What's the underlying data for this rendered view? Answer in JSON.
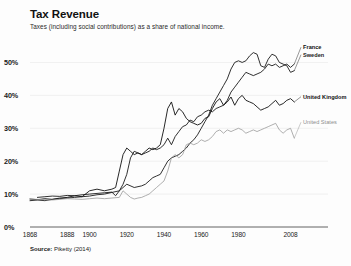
{
  "header": {
    "title": "Tax Revenue",
    "subtitle": "Taxes (including social contributions) as a share of national income."
  },
  "footer": {
    "source_label": "Source:",
    "source_value": "Piketty (2014)"
  },
  "legend": [
    {
      "name": "france-label",
      "label": "France",
      "color": "#1a1a1a",
      "weight": "bold"
    },
    {
      "name": "sweden-label",
      "label": "Sweden",
      "color": "#1a1a1a",
      "weight": "bold"
    },
    {
      "name": "united-kingdom-label",
      "label": "United Kingdom",
      "color": "#111111",
      "weight": "bold"
    },
    {
      "name": "united-states-label",
      "label": "United States",
      "color": "#8d8d8d",
      "weight": "normal"
    }
  ],
  "chart_data": {
    "type": "line",
    "title": "Tax Revenue",
    "subtitle": "Taxes (including social contributions) as a share of national income.",
    "xlabel": "",
    "ylabel": "",
    "xlim": [
      1868,
      2012
    ],
    "ylim": [
      0,
      55
    ],
    "grid": true,
    "legend_position": "right-inline",
    "ytick_labels": [
      "0%",
      "10%",
      "20%",
      "30%",
      "40%",
      "50%"
    ],
    "ytick_values": [
      0,
      10,
      20,
      30,
      40,
      50
    ],
    "xtick_labels": [
      "1868",
      "1888",
      "1900",
      "1920",
      "1940",
      "1960",
      "1980",
      "2008"
    ],
    "xtick_values": [
      1868,
      1888,
      1900,
      1920,
      1940,
      1960,
      1980,
      2008
    ],
    "series": [
      {
        "name": "France",
        "color": "#1a1a1a",
        "width": 0.9,
        "x": [
          1872,
          1876,
          1880,
          1884,
          1888,
          1892,
          1896,
          1900,
          1904,
          1908,
          1912,
          1914,
          1916,
          1918,
          1920,
          1922,
          1924,
          1926,
          1928,
          1930,
          1932,
          1934,
          1936,
          1938,
          1940,
          1942,
          1944,
          1946,
          1948,
          1950,
          1952,
          1954,
          1956,
          1958,
          1960,
          1962,
          1964,
          1966,
          1968,
          1970,
          1972,
          1974,
          1976,
          1978,
          1980,
          1982,
          1984,
          1986,
          1988,
          1990,
          1992,
          1994,
          1996,
          1998,
          2000,
          2002,
          2004,
          2006,
          2008,
          2010
        ],
        "y": [
          9.0,
          9.2,
          9.4,
          9.3,
          9.6,
          9.5,
          9.8,
          10.0,
          10.2,
          10.4,
          10.6,
          9.5,
          11.0,
          13.0,
          16.0,
          21.0,
          23.0,
          22.5,
          22.0,
          22.5,
          23.0,
          24.0,
          23.5,
          24.0,
          25.0,
          27.0,
          25.0,
          27.5,
          29.0,
          30.5,
          31.0,
          32.5,
          32.0,
          33.5,
          34.0,
          35.0,
          35.5,
          35.0,
          36.0,
          36.5,
          37.0,
          38.5,
          41.0,
          42.5,
          44.0,
          45.5,
          47.0,
          46.5,
          46.0,
          46.5,
          47.0,
          48.0,
          49.5,
          49.0,
          49.5,
          48.5,
          49.0,
          49.5,
          48.5,
          49.5
        ]
      },
      {
        "name": "Sweden",
        "color": "#1a1a1a",
        "width": 0.9,
        "x": [
          1868,
          1872,
          1876,
          1880,
          1884,
          1888,
          1892,
          1896,
          1900,
          1904,
          1908,
          1912,
          1916,
          1920,
          1924,
          1928,
          1930,
          1932,
          1934,
          1936,
          1938,
          1940,
          1942,
          1944,
          1946,
          1948,
          1950,
          1952,
          1954,
          1956,
          1958,
          1960,
          1962,
          1964,
          1966,
          1968,
          1970,
          1972,
          1974,
          1976,
          1978,
          1980,
          1982,
          1984,
          1986,
          1988,
          1990,
          1992,
          1994,
          1996,
          1998,
          2000,
          2002,
          2004,
          2006,
          2008,
          2010
        ],
        "y": [
          8.0,
          8.2,
          8.0,
          8.4,
          8.6,
          8.8,
          9.0,
          9.2,
          9.4,
          9.8,
          10.0,
          10.5,
          11.0,
          13.0,
          12.0,
          12.5,
          13.0,
          14.0,
          15.0,
          15.5,
          16.0,
          18.0,
          20.0,
          21.0,
          21.5,
          22.0,
          23.0,
          24.0,
          25.5,
          26.5,
          28.0,
          30.0,
          32.0,
          34.0,
          37.0,
          39.0,
          41.0,
          43.0,
          45.0,
          48.0,
          50.0,
          50.5,
          50.0,
          50.5,
          52.0,
          53.0,
          52.5,
          49.0,
          48.5,
          51.0,
          52.5,
          52.0,
          50.0,
          49.5,
          49.0,
          47.0,
          47.5
        ]
      },
      {
        "name": "United Kingdom",
        "color": "#111111",
        "width": 0.9,
        "x": [
          1868,
          1872,
          1876,
          1880,
          1884,
          1888,
          1892,
          1896,
          1900,
          1904,
          1908,
          1912,
          1914,
          1916,
          1918,
          1920,
          1922,
          1924,
          1926,
          1928,
          1930,
          1932,
          1934,
          1936,
          1938,
          1940,
          1942,
          1944,
          1946,
          1948,
          1950,
          1952,
          1954,
          1956,
          1958,
          1960,
          1962,
          1964,
          1966,
          1968,
          1970,
          1972,
          1974,
          1976,
          1978,
          1980,
          1982,
          1984,
          1986,
          1988,
          1990,
          1992,
          1994,
          1996,
          1998,
          2000,
          2002,
          2004,
          2006,
          2008,
          2010
        ],
        "y": [
          8.5,
          8.3,
          8.6,
          8.4,
          8.8,
          9.0,
          9.5,
          9.2,
          11.0,
          11.5,
          11.0,
          11.5,
          12.0,
          17.0,
          22.0,
          24.0,
          23.0,
          22.0,
          22.5,
          22.0,
          23.0,
          24.0,
          23.5,
          24.0,
          25.0,
          30.0,
          36.0,
          38.0,
          34.0,
          36.0,
          35.0,
          33.0,
          32.0,
          31.5,
          31.0,
          31.5,
          33.0,
          33.5,
          36.0,
          38.0,
          39.0,
          37.0,
          38.0,
          39.5,
          37.0,
          39.0,
          40.0,
          38.5,
          38.0,
          37.5,
          36.5,
          35.5,
          36.0,
          36.5,
          37.5,
          38.5,
          37.0,
          37.5,
          38.5,
          39.0,
          38.0
        ]
      },
      {
        "name": "United States",
        "color": "#9a9a9a",
        "width": 0.8,
        "x": [
          1868,
          1872,
          1876,
          1880,
          1884,
          1888,
          1892,
          1896,
          1900,
          1904,
          1908,
          1912,
          1916,
          1918,
          1920,
          1922,
          1924,
          1926,
          1928,
          1930,
          1932,
          1934,
          1936,
          1938,
          1940,
          1942,
          1944,
          1946,
          1948,
          1950,
          1952,
          1954,
          1956,
          1958,
          1960,
          1962,
          1964,
          1966,
          1968,
          1970,
          1972,
          1974,
          1976,
          1978,
          1980,
          1982,
          1984,
          1986,
          1988,
          1990,
          1992,
          1994,
          1996,
          1998,
          2000,
          2002,
          2004,
          2006,
          2008,
          2010
        ],
        "y": [
          8.5,
          8.4,
          8.3,
          8.2,
          8.4,
          8.6,
          8.5,
          8.4,
          8.6,
          8.8,
          8.6,
          8.8,
          9.0,
          11.0,
          10.0,
          9.0,
          8.5,
          8.8,
          9.0,
          9.5,
          10.0,
          11.0,
          12.0,
          13.0,
          14.0,
          17.0,
          21.0,
          22.0,
          21.0,
          22.0,
          25.0,
          25.5,
          25.0,
          25.5,
          26.5,
          26.0,
          26.5,
          27.5,
          29.0,
          29.5,
          28.5,
          29.5,
          29.0,
          29.5,
          30.0,
          29.5,
          28.5,
          29.0,
          29.5,
          29.0,
          29.5,
          30.0,
          30.5,
          31.0,
          31.5,
          29.5,
          28.5,
          29.5,
          30.0,
          27.0
        ]
      }
    ]
  },
  "plot_geometry": {
    "left": 30,
    "right": 298,
    "top": 46,
    "bottom": 227
  }
}
